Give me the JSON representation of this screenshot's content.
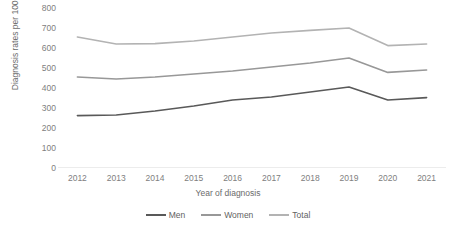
{
  "chart_data": {
    "type": "line",
    "title": "",
    "xlabel": "Year of diagnosis",
    "ylabel": "Diagnosis rates per 100,000",
    "categories": [
      "2012",
      "2013",
      "2014",
      "2015",
      "2016",
      "2017",
      "2018",
      "2019",
      "2020",
      "2021"
    ],
    "x": [
      2012,
      2013,
      2014,
      2015,
      2016,
      2017,
      2018,
      2019,
      2020,
      2021
    ],
    "ylim": [
      0,
      800
    ],
    "yticks": [
      0,
      100,
      200,
      300,
      400,
      500,
      600,
      700,
      800
    ],
    "ytick_labels": [
      "0",
      "100",
      "200",
      "300",
      "400",
      "500",
      "600",
      "700",
      "800"
    ],
    "grid": false,
    "legend_position": "bottom",
    "series": [
      {
        "name": "Men",
        "color": "#595959",
        "values": [
          262,
          265,
          285,
          310,
          340,
          355,
          380,
          405,
          340,
          352
        ]
      },
      {
        "name": "Women",
        "color": "#989898",
        "values": [
          455,
          445,
          455,
          470,
          485,
          505,
          525,
          550,
          478,
          490
        ]
      },
      {
        "name": "Total",
        "color": "#b3b3b3",
        "values": [
          655,
          620,
          622,
          635,
          655,
          675,
          688,
          700,
          612,
          620
        ]
      }
    ]
  },
  "axis": {
    "x_title": "Year of diagnosis",
    "y_title": "Diagnosis rates per 100,000",
    "axis_line_color": "#d9d9d9"
  },
  "legend": {
    "items": [
      {
        "label": "Men",
        "color": "#595959"
      },
      {
        "label": "Women",
        "color": "#989898"
      },
      {
        "label": "Total",
        "color": "#b3b3b3"
      }
    ]
  }
}
